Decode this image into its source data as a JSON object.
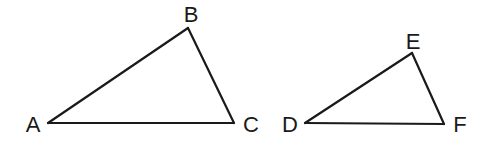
{
  "diagram": {
    "type": "similar-triangles",
    "triangles": [
      {
        "name": "ABC",
        "vertices": [
          "A",
          "B",
          "C"
        ],
        "sides": [
          [
            "A",
            "B"
          ],
          [
            "B",
            "C"
          ],
          [
            "C",
            "A"
          ]
        ]
      },
      {
        "name": "DEF",
        "vertices": [
          "D",
          "E",
          "F"
        ],
        "sides": [
          [
            "D",
            "E"
          ],
          [
            "E",
            "F"
          ],
          [
            "F",
            "D"
          ]
        ]
      }
    ],
    "labels": {
      "A": "A",
      "B": "B",
      "C": "C",
      "D": "D",
      "E": "E",
      "F": "F"
    },
    "colors": {
      "stroke": "#1a1a1a",
      "background": "#ffffff"
    }
  }
}
